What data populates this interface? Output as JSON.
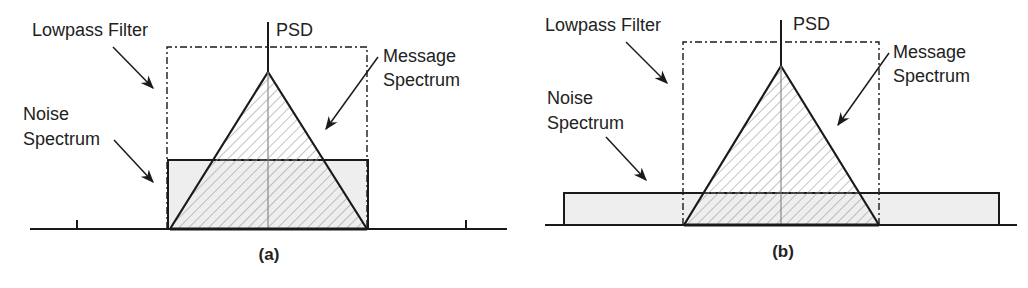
{
  "figure": {
    "panels": [
      {
        "id": "a",
        "caption": "(a)",
        "labels": {
          "psd": "PSD",
          "lowpass_filter": "Lowpass Filter",
          "message_spectrum_line1": "Message",
          "message_spectrum_line2": "Spectrum",
          "noise_spectrum_line1": "Noise",
          "noise_spectrum_line2": "Spectrum"
        },
        "description": "Noise spectrum bandwidth equals filter bandwidth"
      },
      {
        "id": "b",
        "caption": "(b)",
        "labels": {
          "psd": "PSD",
          "lowpass_filter": "Lowpass Filter",
          "message_spectrum_line1": "Message",
          "message_spectrum_line2": "Spectrum",
          "noise_spectrum_line1": "Noise",
          "noise_spectrum_line2": "Spectrum"
        },
        "description": "Noise spectrum wider than filter bandwidth"
      }
    ],
    "colors": {
      "line": "#1a1a1a",
      "noise_fill": "#eeeeee",
      "hatch": "#999999"
    }
  }
}
